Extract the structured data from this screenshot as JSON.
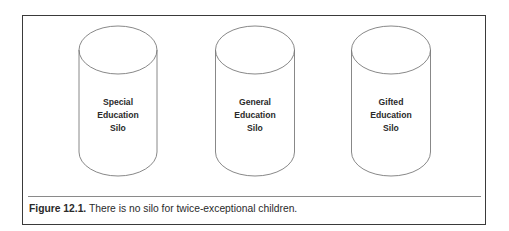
{
  "figure": {
    "silos": [
      {
        "lines": [
          "Special",
          "Education",
          "Silo"
        ]
      },
      {
        "lines": [
          "General",
          "Education",
          "Silo"
        ]
      },
      {
        "lines": [
          "Gifted",
          "Education",
          "Silo"
        ]
      }
    ],
    "caption": {
      "label": "Figure 12.1.",
      "text": " There is no silo for twice-exceptional children."
    },
    "colors": {
      "stroke": "#7a7a7a",
      "border": "#3a3a3a",
      "text": "#2a2a2a"
    }
  }
}
